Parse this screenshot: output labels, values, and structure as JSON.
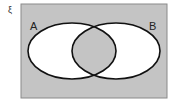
{
  "diagram": {
    "type": "venn",
    "universal_symbol": "ξ",
    "sets": [
      {
        "label": "A"
      },
      {
        "label": "B"
      }
    ],
    "shaded_regions": [
      "outside A ∪ B",
      "A ∩ B"
    ],
    "unshaded_regions": [
      "A only",
      "B only"
    ],
    "colors": {
      "shade": "#c4c4c4",
      "unshaded": "#ffffff",
      "outline": "#111111",
      "frame": "#8a8a8a"
    }
  }
}
